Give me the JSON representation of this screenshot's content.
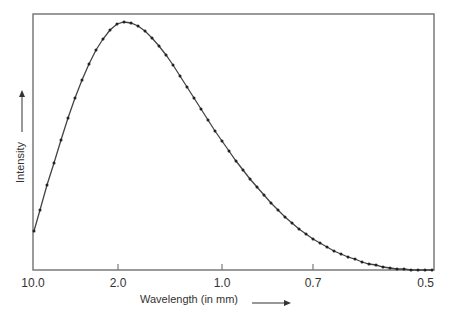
{
  "chart_data": {
    "type": "line",
    "title": "",
    "xlabel": "Wavelength (in mm)",
    "ylabel": "Intensity",
    "x_ticks": [
      "10.0",
      "2.0",
      "1.0",
      "0.7",
      "0.5"
    ],
    "grid": false,
    "legend": null,
    "markers": true,
    "annotations": [
      "arrow pointing right after x-axis label",
      "arrow pointing up after y-axis label"
    ],
    "series": [
      {
        "name": "Intensity",
        "points_px": [
          [
            34,
            231
          ],
          [
            40,
            210
          ],
          [
            47,
            185
          ],
          [
            54,
            163
          ],
          [
            61,
            140
          ],
          [
            68,
            118
          ],
          [
            75,
            98
          ],
          [
            82,
            80
          ],
          [
            89,
            64
          ],
          [
            96,
            50
          ],
          [
            103,
            39
          ],
          [
            110,
            30
          ],
          [
            117,
            24
          ],
          [
            124,
            22
          ],
          [
            131,
            23
          ],
          [
            138,
            26
          ],
          [
            145,
            31
          ],
          [
            152,
            38
          ],
          [
            159,
            46
          ],
          [
            166,
            55
          ],
          [
            173,
            65
          ],
          [
            180,
            76
          ],
          [
            187,
            87
          ],
          [
            194,
            98
          ],
          [
            201,
            109
          ],
          [
            208,
            120
          ],
          [
            215,
            131
          ],
          [
            222,
            141
          ],
          [
            229,
            151
          ],
          [
            236,
            161
          ],
          [
            243,
            170
          ],
          [
            250,
            179
          ],
          [
            257,
            187
          ],
          [
            264,
            195
          ],
          [
            271,
            203
          ],
          [
            278,
            210
          ],
          [
            285,
            217
          ],
          [
            292,
            223
          ],
          [
            299,
            229
          ],
          [
            306,
            234
          ],
          [
            313,
            239
          ],
          [
            320,
            243
          ],
          [
            327,
            247
          ],
          [
            334,
            251
          ],
          [
            341,
            254
          ],
          [
            348,
            257
          ],
          [
            355,
            259
          ],
          [
            362,
            262
          ],
          [
            369,
            264
          ],
          [
            376,
            265
          ],
          [
            383,
            267
          ],
          [
            390,
            268
          ],
          [
            397,
            269
          ],
          [
            404,
            269
          ],
          [
            411,
            270
          ],
          [
            418,
            270
          ],
          [
            425,
            270
          ],
          [
            432,
            270
          ]
        ]
      }
    ]
  },
  "colors": {
    "frame": "#7a7a7a",
    "curve": "#444444",
    "marker": "#222222",
    "text": "#333333"
  }
}
